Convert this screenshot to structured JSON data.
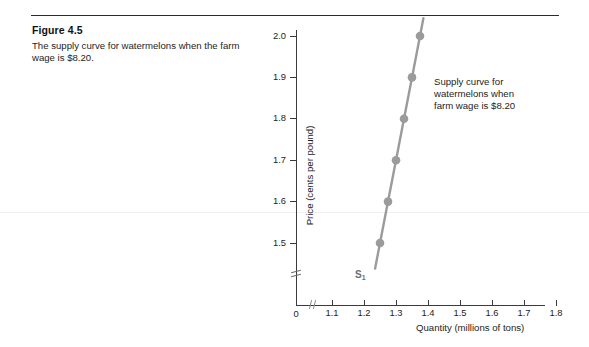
{
  "figure": {
    "number_label": "Figure 4.5",
    "description_line1": "The supply curve for watermelons when",
    "description_line2": "the farm wage is $8.20."
  },
  "chart_data": {
    "type": "line",
    "title": "",
    "xlabel": "Quantity (millions of tons)",
    "ylabel": "Price (cents per pound)",
    "xlim": [
      1.05,
      1.85
    ],
    "ylim": [
      1.44,
      2.05
    ],
    "grid": false,
    "legend_position": "none",
    "origin_label": "0",
    "x_ticks": [
      "1.1",
      "1.2",
      "1.3",
      "1.4",
      "1.5",
      "1.6",
      "1.7",
      "1.8"
    ],
    "x_tick_values": [
      1.1,
      1.2,
      1.3,
      1.4,
      1.5,
      1.6,
      1.7,
      1.8
    ],
    "y_ticks": [
      "1.5",
      "1.6",
      "1.7",
      "1.8",
      "1.9",
      "2.0"
    ],
    "y_tick_values": [
      1.5,
      1.6,
      1.7,
      1.8,
      1.9,
      2.0
    ],
    "axis_break_x": true,
    "axis_break_y": true,
    "series": [
      {
        "name": "S1",
        "curve_label": "S",
        "curve_label_subscript": "1",
        "color": "#9b9b9b",
        "x": [
          1.25,
          1.275,
          1.3,
          1.325,
          1.35,
          1.375
        ],
        "y": [
          1.5,
          1.6,
          1.7,
          1.8,
          1.9,
          2.0
        ]
      }
    ],
    "annotations": [
      {
        "name": "supply-curve-note",
        "line1": "Supply curve for",
        "line2": "watermelons when",
        "line3": "farm wage is $8.20"
      }
    ]
  },
  "colors": {
    "curve": "#9b9b9b",
    "axis": "#3a3a3a",
    "text": "#1d1d1d",
    "rule": "#2b2b2b"
  }
}
